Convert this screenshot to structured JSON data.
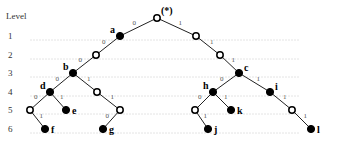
{
  "level_axis": {
    "title": "Level",
    "levels": [
      {
        "label": "1",
        "y": 36
      },
      {
        "label": "2",
        "y": 55
      },
      {
        "label": "3",
        "y": 73
      },
      {
        "label": "4",
        "y": 92
      },
      {
        "label": "5",
        "y": 110
      },
      {
        "label": "6",
        "y": 129
      }
    ]
  },
  "root": {
    "label": "(*)"
  },
  "nodes": [
    {
      "id": "root",
      "x": 157,
      "y": 18,
      "type": "open",
      "label": "(*)"
    },
    {
      "id": "a",
      "x": 120,
      "y": 36,
      "type": "filled",
      "label": "a"
    },
    {
      "id": "r1",
      "x": 196,
      "y": 36,
      "type": "open",
      "label": ""
    },
    {
      "id": "l2",
      "x": 96,
      "y": 55,
      "type": "open",
      "label": ""
    },
    {
      "id": "r2",
      "x": 220,
      "y": 55,
      "type": "open",
      "label": ""
    },
    {
      "id": "b",
      "x": 73,
      "y": 73,
      "type": "filled",
      "label": "b"
    },
    {
      "id": "c",
      "x": 239,
      "y": 73,
      "type": "filled",
      "label": "c"
    },
    {
      "id": "d",
      "x": 50,
      "y": 92,
      "type": "filled",
      "label": "d"
    },
    {
      "id": "b1",
      "x": 97,
      "y": 92,
      "type": "open",
      "label": ""
    },
    {
      "id": "h",
      "x": 213,
      "y": 92,
      "type": "filled",
      "label": "h"
    },
    {
      "id": "i",
      "x": 270,
      "y": 92,
      "type": "filled",
      "label": "i"
    },
    {
      "id": "d0",
      "x": 30,
      "y": 110,
      "type": "open",
      "label": ""
    },
    {
      "id": "e",
      "x": 66,
      "y": 110,
      "type": "filled",
      "label": "e"
    },
    {
      "id": "b11",
      "x": 120,
      "y": 110,
      "type": "open",
      "label": ""
    },
    {
      "id": "h0",
      "x": 195,
      "y": 110,
      "type": "open",
      "label": ""
    },
    {
      "id": "k",
      "x": 231,
      "y": 110,
      "type": "filled",
      "label": "k"
    },
    {
      "id": "i1",
      "x": 292,
      "y": 110,
      "type": "open",
      "label": ""
    },
    {
      "id": "f",
      "x": 45,
      "y": 129,
      "type": "filled",
      "label": "f"
    },
    {
      "id": "g",
      "x": 103,
      "y": 129,
      "type": "filled",
      "label": "g"
    },
    {
      "id": "j",
      "x": 208,
      "y": 129,
      "type": "filled",
      "label": "j"
    },
    {
      "id": "l",
      "x": 311,
      "y": 129,
      "type": "filled",
      "label": "l"
    }
  ],
  "edges": [
    {
      "from": "root",
      "to": "a",
      "label": "0"
    },
    {
      "from": "root",
      "to": "r1",
      "label": "1"
    },
    {
      "from": "a",
      "to": "l2",
      "label": "0"
    },
    {
      "from": "r1",
      "to": "r2",
      "label": "1"
    },
    {
      "from": "l2",
      "to": "b",
      "label": "0"
    },
    {
      "from": "r2",
      "to": "c",
      "label": "1"
    },
    {
      "from": "b",
      "to": "d",
      "label": "0"
    },
    {
      "from": "b",
      "to": "b1",
      "label": "1"
    },
    {
      "from": "c",
      "to": "h",
      "label": "0"
    },
    {
      "from": "c",
      "to": "i",
      "label": "1"
    },
    {
      "from": "d",
      "to": "d0",
      "label": "0"
    },
    {
      "from": "d",
      "to": "e",
      "label": "1"
    },
    {
      "from": "b1",
      "to": "b11",
      "label": "1"
    },
    {
      "from": "h",
      "to": "h0",
      "label": "0"
    },
    {
      "from": "h",
      "to": "k",
      "label": "1"
    },
    {
      "from": "i",
      "to": "i1",
      "label": "1"
    },
    {
      "from": "d0",
      "to": "f",
      "label": "1"
    },
    {
      "from": "b11",
      "to": "g",
      "label": "0"
    },
    {
      "from": "h0",
      "to": "j",
      "label": "1"
    },
    {
      "from": "i1",
      "to": "l",
      "label": "1"
    }
  ],
  "colors": {
    "edge": "#222222",
    "filled_node": "#000000",
    "open_node_fill": "#ffffff",
    "gridline": "#e4e4e4"
  }
}
